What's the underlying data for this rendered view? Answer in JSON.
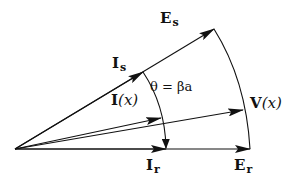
{
  "diagram": {
    "labels": {
      "Es": {
        "main": "E",
        "sub": "s"
      },
      "Is": {
        "main": "I",
        "sub": "s"
      },
      "Ix": {
        "main": "I",
        "arg": "(x)"
      },
      "Vx": {
        "main": "V",
        "arg": "(x)"
      },
      "Ir": {
        "main": "I",
        "sub": "r"
      },
      "Er": {
        "main": "E",
        "sub": "r"
      },
      "theta": "θ = βa"
    },
    "points": {
      "origin": [
        15,
        149
      ],
      "Es_tip": [
        214,
        29
      ],
      "Is_tip": [
        143,
        72
      ],
      "Vx_tip": [
        243,
        110
      ],
      "Ix_tip": [
        161,
        118
      ],
      "Er_tip": [
        250,
        149
      ],
      "Ir_tip": [
        166,
        149
      ]
    },
    "colors": {
      "stroke": "#111111",
      "background": "#ffffff"
    }
  }
}
